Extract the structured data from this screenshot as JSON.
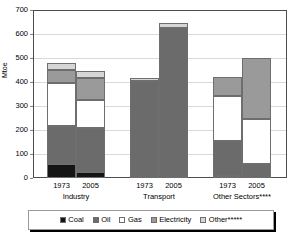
{
  "chart_data": {
    "type": "bar",
    "subtype": "stacked",
    "title": "",
    "xlabel": "",
    "ylabel": "Mtoe",
    "ylim": [
      0,
      700
    ],
    "ytick_step": 100,
    "yticks": [
      "700",
      "600",
      "500",
      "400",
      "300",
      "200",
      "100",
      "0"
    ],
    "grid": true,
    "legend_position": "bottom",
    "categories": [
      "1973",
      "2005",
      "1973",
      "2005",
      "1973",
      "2005"
    ],
    "groups": [
      {
        "name": "Industry",
        "years": [
          "1973",
          "2005"
        ]
      },
      {
        "name": "Transport",
        "years": [
          "1973",
          "2005"
        ]
      },
      {
        "name": "Other Sectors****",
        "years": [
          "1973",
          "2005"
        ]
      }
    ],
    "series": [
      {
        "name": "Coal",
        "color": "#151515",
        "values": [
          60,
          25,
          0,
          0,
          10,
          0
        ]
      },
      {
        "name": "Oil",
        "color": "#6b6b6b",
        "values": [
          155,
          185,
          405,
          625,
          145,
          60
        ]
      },
      {
        "name": "Gas",
        "color": "#ffffff",
        "values": [
          180,
          115,
          0,
          0,
          185,
          185
        ]
      },
      {
        "name": "Electricity",
        "color": "#9a9a9a",
        "values": [
          55,
          90,
          0,
          0,
          80,
          255
        ]
      },
      {
        "name": "Other*****",
        "color": "#d6d6d6",
        "values": [
          30,
          30,
          10,
          20,
          0,
          0
        ]
      }
    ],
    "totals": [
      480,
      445,
      415,
      645,
      420,
      500
    ]
  },
  "legend": {
    "items": [
      {
        "label": "Coal"
      },
      {
        "label": "Oil"
      },
      {
        "label": "Gas"
      },
      {
        "label": "Electricity"
      },
      {
        "label": "Other*****"
      }
    ]
  }
}
